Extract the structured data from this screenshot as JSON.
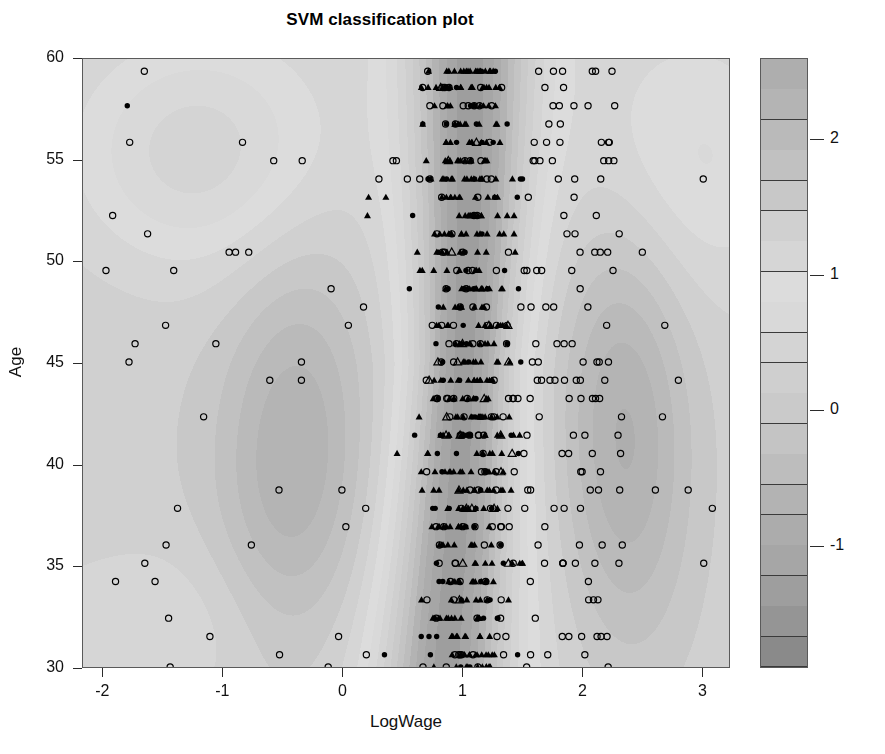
{
  "chart_data": {
    "type": "scatter",
    "title": "SVM classification plot",
    "xlabel": "LogWage",
    "ylabel": "Age",
    "xlim": [
      -2.17,
      3.23
    ],
    "ylim": [
      30.0,
      60.0
    ],
    "xticks": [
      -2,
      -1,
      0,
      1,
      2,
      3
    ],
    "xtick_labels": [
      "-2",
      "-1",
      "0",
      "1",
      "2",
      "3"
    ],
    "yticks": [
      30,
      35,
      40,
      45,
      50,
      55,
      60
    ],
    "ytick_labels": [
      "30",
      "35",
      "40",
      "45",
      "50",
      "55",
      "60"
    ],
    "grid": false,
    "legend": "colorbar-right",
    "colorbar": {
      "ticks": [
        -1,
        0,
        1,
        2
      ],
      "tick_labels": [
        "-1",
        "0",
        "1",
        "2"
      ],
      "range": [
        -1.9,
        2.6
      ],
      "n_bands": 20,
      "band_colors": [
        "#8a8a8a",
        "#959595",
        "#9e9e9e",
        "#a6a6a6",
        "#acacac",
        "#b3b3b3",
        "#bdbdbd",
        "#c4c4c4",
        "#cacaca",
        "#cfcfcf",
        "#d4d4d4",
        "#d9d9d9",
        "#dcdcdc",
        "#d6d6d6",
        "#d0d0d0",
        "#c8c8c8",
        "#c1c1c1",
        "#bababa",
        "#b4b4b4",
        "#aeaeae"
      ]
    },
    "surface": {
      "description": "SVM decision value surface over LogWage x Age, shaded grey contour bands; bright ridge near LogWage 0.9-1.2, darker lobes near LogWage -0.4 and 2.3",
      "colormap": "grey",
      "vmin": -1.9,
      "vmax": 2.6
    },
    "marker_classes": [
      {
        "name": "filled-circle",
        "meaning": "class 1 non-support vector",
        "fill": "#000000",
        "shape": "circle"
      },
      {
        "name": "filled-triangle",
        "meaning": "class 1 support vector",
        "fill": "#000000",
        "shape": "triangle"
      },
      {
        "name": "open-circle",
        "meaning": "class 2 non-support vector",
        "fill": "none",
        "shape": "circle"
      },
      {
        "name": "open-triangle",
        "meaning": "class 2 support vector",
        "fill": "none",
        "shape": "triangle"
      }
    ],
    "point_rows_age": [
      59.4,
      58.6,
      57.7,
      56.8,
      55.9,
      55.0,
      54.1,
      53.2,
      52.3,
      51.4,
      50.5,
      49.6,
      48.7,
      47.8,
      46.9,
      46.0,
      45.1,
      44.2,
      43.3,
      42.4,
      41.5,
      40.6,
      39.7,
      38.8,
      37.9,
      37.0,
      36.1,
      35.2,
      34.3,
      33.4,
      32.5,
      31.6,
      30.7,
      30.1
    ],
    "x_cluster_center": 1.05,
    "n_points_approx": 780
  },
  "colors": {
    "axis": "#2b2b2b",
    "text": "#111111",
    "panel_border": "#5a5a5a",
    "marker": "#000000",
    "background": "#ffffff"
  }
}
